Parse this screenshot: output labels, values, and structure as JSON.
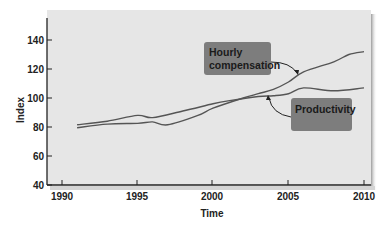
{
  "chart_data": {
    "type": "line",
    "title": "",
    "xlabel": "Time",
    "ylabel": "Index",
    "xlim": [
      1990,
      2010
    ],
    "ylim": [
      40,
      150
    ],
    "x_ticks": [
      1990,
      1995,
      2000,
      2005,
      2010
    ],
    "y_ticks": [
      40,
      60,
      80,
      100,
      120,
      140
    ],
    "grid": false,
    "legend": "none (callout labels with arrows)",
    "series": [
      {
        "name": "Productivity",
        "x": [
          1991,
          1993,
          1995,
          1996,
          1998,
          2000,
          2001,
          2003,
          2004,
          2005,
          2006,
          2008,
          2010
        ],
        "values": [
          81.5,
          84,
          88,
          86.5,
          91,
          96,
          98,
          101,
          101.5,
          103,
          107,
          105,
          107
        ]
      },
      {
        "name": "Hourly compensation",
        "x": [
          1991,
          1993,
          1995,
          1996,
          1997,
          1999,
          2000,
          2002,
          2003,
          2004,
          2005,
          2006,
          2008,
          2009,
          2010
        ],
        "values": [
          79.5,
          82,
          82.5,
          83.5,
          81.5,
          88,
          93,
          100,
          103,
          106,
          111,
          118,
          125,
          130,
          132
        ]
      }
    ],
    "annotations": [
      {
        "text": "Hourly compensation",
        "points_to": "Hourly compensation",
        "near_x": 2006
      },
      {
        "text": "Productivity",
        "points_to": "Productivity",
        "near_x": 2004
      }
    ]
  },
  "labels": {
    "ylabel": "Index",
    "xlabel": "Time",
    "y_ticks": [
      "40",
      "60",
      "80",
      "100",
      "120",
      "140"
    ],
    "x_ticks": [
      "1990",
      "1995",
      "2000",
      "2005",
      "2010"
    ],
    "callout_hourly_line1": "Hourly",
    "callout_hourly_line2": "compensation",
    "callout_productivity": "Productivity"
  },
  "colors": {
    "plot_bg": "#e6e6e6",
    "line": "#555555",
    "callout_bg": "#7d7d7d",
    "axis": "#222222"
  }
}
